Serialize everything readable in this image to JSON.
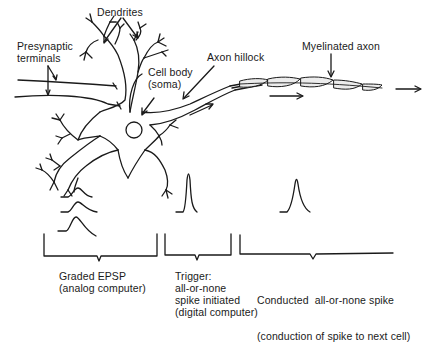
{
  "diagram": {
    "labels": {
      "dendrites": "Dendrites",
      "presynaptic_line1": "Presynaptic",
      "presynaptic_line2": "terminals",
      "cell_body_line1": "Cell body",
      "cell_body_line2": "(soma)",
      "axon_hillock": "Axon hillock",
      "myelinated_axon": "Myelinated axon"
    },
    "stages": [
      {
        "id": "graded-epsp",
        "lines": [
          "Graded EPSP",
          "(analog computer)"
        ]
      },
      {
        "id": "trigger",
        "lines": [
          "Trigger:",
          "all-or-none",
          "spike initiated",
          "(digital computer)"
        ]
      },
      {
        "id": "conducted-spike",
        "lines": [
          "Conducted  all-or-none spike",
          "(conduction of spike to next cell)"
        ]
      }
    ],
    "colors": {
      "ink": "#1a1a1a",
      "background": "#ffffff",
      "myelin": "#e8e8e8"
    }
  }
}
